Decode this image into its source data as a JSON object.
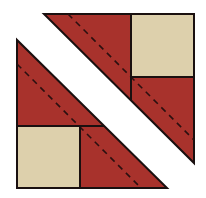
{
  "diagram": {
    "colors": {
      "red": "#a8322c",
      "beige": "#ddd0ac",
      "outline": "#1a1010",
      "stitch": "#2a1010",
      "background": "#ffffff"
    },
    "pieces": [
      {
        "name": "upper-right-triangle",
        "fill": "red",
        "points": "44,14 194,14 194,163"
      },
      {
        "name": "upper-right-square",
        "fill": "beige",
        "x": 131,
        "y": 14,
        "w": 63,
        "h": 63
      },
      {
        "name": "lower-left-triangle",
        "fill": "red",
        "points": "17,40 17,188 167,188"
      },
      {
        "name": "lower-left-square",
        "fill": "beige",
        "x": 17,
        "y": 126,
        "w": 63,
        "h": 62
      }
    ],
    "stitch_lines": [
      {
        "name": "upper-right-stitch-line",
        "x1": 68,
        "y1": 14,
        "x2": 194,
        "y2": 140
      },
      {
        "name": "lower-left-stitch-line",
        "x1": 17,
        "y1": 64,
        "x2": 141,
        "y2": 188
      }
    ]
  }
}
